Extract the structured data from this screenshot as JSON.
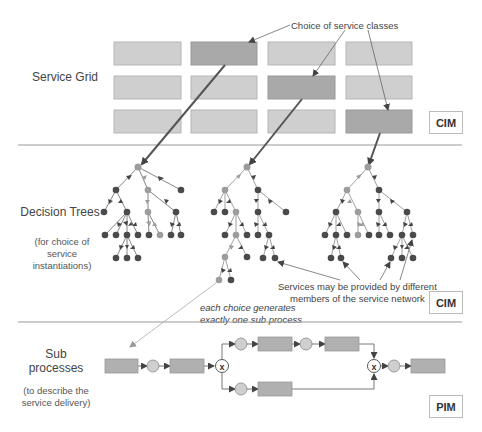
{
  "sections": {
    "service_grid": {
      "label": "Service Grid",
      "badge": "CIM",
      "annotation": "Choice of service classes",
      "grid": {
        "rows": 3,
        "cols": 4,
        "selected_cells": [
          [
            0,
            1
          ],
          [
            1,
            2
          ],
          [
            2,
            3
          ]
        ]
      }
    },
    "decision_trees": {
      "label": "Decision Trees",
      "sublabel_1": "(for choice of",
      "sublabel_2": "service",
      "sublabel_3": "instantiations)",
      "badge": "CIM",
      "annotation_1": "Services may be provided by different",
      "annotation_2": "members of the service network",
      "choice_note_1": "each choice generates",
      "choice_note_2": "exactly one sub process",
      "tree_count": 3
    },
    "sub_processes": {
      "label_1": "Sub",
      "label_2": "processes",
      "sublabel_1": "(to describe the",
      "sublabel_2": "service delivery)",
      "badge": "PIM",
      "gateway_symbol": "x"
    }
  },
  "colors": {
    "cell": "#cfcfcf",
    "cell_selected": "#a9a9a9",
    "cell_border": "#b5b5b5",
    "node_dark": "#4a4a4a",
    "node_light": "#9c9c9c",
    "arrow_dark": "#555555",
    "separator": "#999999"
  }
}
